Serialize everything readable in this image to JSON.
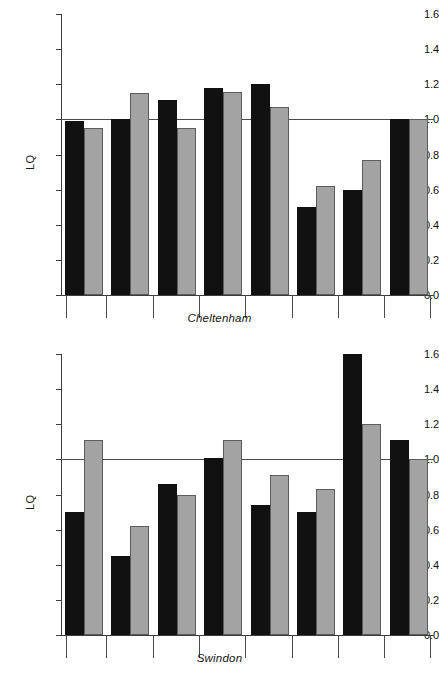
{
  "figure": {
    "background": "#ffffff",
    "colors": {
      "series_1": "#111111",
      "series_2": "#a3a3a3",
      "axis": "#3c3c3c",
      "reference_line": "#4a4a4a"
    }
  },
  "chart_data": [
    {
      "type": "bar",
      "title": "Cheltenham",
      "xlabel": "Cheltenham",
      "ylabel": "LQ",
      "ylim": [
        0.0,
        1.6
      ],
      "ytick_labels": [
        "0.0",
        "0.2",
        "0.4",
        "0.6",
        "0.8",
        "1.0",
        "1.2",
        "1.4",
        "1.6"
      ],
      "ytick_values": [
        0.0,
        0.2,
        0.4,
        0.6,
        0.8,
        1.0,
        1.2,
        1.4,
        1.6
      ],
      "grid": false,
      "legend": "none",
      "reference_line": 1.0,
      "categories": [
        "1",
        "2",
        "3",
        "4",
        "5",
        "6",
        "7",
        "8"
      ],
      "series": [
        {
          "name": "series-1-dark",
          "color": "#111111",
          "values": [
            0.99,
            1.0,
            1.11,
            1.18,
            1.2,
            0.5,
            0.6,
            1.0
          ]
        },
        {
          "name": "series-2-light",
          "color": "#a3a3a3",
          "values": [
            0.95,
            1.15,
            0.95,
            1.155,
            1.07,
            0.62,
            0.77,
            1.0
          ]
        }
      ]
    },
    {
      "type": "bar",
      "title": "Swindon",
      "xlabel": "Swindon",
      "ylabel": "LQ",
      "ylim": [
        0.0,
        1.6
      ],
      "ytick_labels": [
        "0.0",
        "0.2",
        "0.4",
        "0.6",
        "0.8",
        "1.0",
        "1.2",
        "1.4",
        "1.6"
      ],
      "ytick_values": [
        0.0,
        0.2,
        0.4,
        0.6,
        0.8,
        1.0,
        1.2,
        1.4,
        1.6
      ],
      "grid": false,
      "legend": "none",
      "reference_line": 1.0,
      "categories": [
        "1",
        "2",
        "3",
        "4",
        "5",
        "6",
        "7",
        "8"
      ],
      "series": [
        {
          "name": "series-1-dark",
          "color": "#111111",
          "values": [
            0.7,
            0.45,
            0.86,
            1.01,
            0.74,
            0.7,
            1.6,
            1.11
          ]
        },
        {
          "name": "series-2-light",
          "color": "#a3a3a3",
          "values": [
            1.11,
            0.62,
            0.8,
            1.11,
            0.91,
            0.83,
            1.2,
            1.0
          ]
        }
      ]
    }
  ]
}
